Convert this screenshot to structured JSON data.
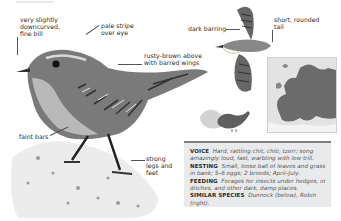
{
  "labels": {
    "bill": [
      "very slightly",
      "downcurved,",
      "fine bill"
    ],
    "eye_stripe": [
      "pale stripe",
      "over eye"
    ],
    "upperparts": [
      "rusty-brown above",
      "with barred wings"
    ],
    "dark_barring": "dark barring",
    "tail": [
      "short, rounded",
      "tail"
    ],
    "faint_bars": "faint bars",
    "legs": [
      "strong",
      "legs and",
      "feet"
    ]
  },
  "info": {
    "voice": {
      "heading": "VOICE",
      "text": "Hard, rattling chit, chiti, tzerr; song amazingly loud, fast, warbling with low trill."
    },
    "nesting": {
      "heading": "NESTING",
      "text": "Small, loose ball of leaves and grass in bank; 5–6 eggs; 2 broods; April–July."
    },
    "feeding": {
      "heading": "FEEDING",
      "text": "Forages for insects under hedges, in ditches, and other dark, damp places."
    },
    "similar": {
      "heading": "SIMILAR SPECIES",
      "text": "Dunnock (below), Robin (right)."
    }
  },
  "colors": {
    "infobox_bg": "#e9eaeb",
    "infobox_rule": "#7b7d80",
    "map_range": "#6b6b6b",
    "map_sea": "#e3e3e3"
  }
}
